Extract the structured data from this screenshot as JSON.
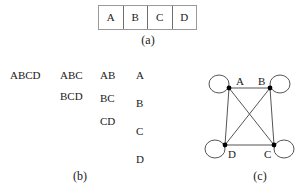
{
  "figure": {
    "background_color": "#ffffff",
    "line_color": "#555555",
    "node_color": "#000000",
    "table_border_color": "#6f6f6f"
  },
  "panel_a": {
    "caption": "(a)",
    "table": {
      "cells": [
        "A",
        "B",
        "C",
        "D"
      ]
    }
  },
  "panel_b": {
    "caption": "(b)",
    "columns": [
      {
        "items": [
          "ABCD"
        ]
      },
      {
        "items": [
          "ABC",
          "BCD"
        ]
      },
      {
        "items": [
          "AB",
          "BC",
          "CD"
        ]
      },
      {
        "items": [
          "A",
          "B",
          "C",
          "D"
        ]
      }
    ]
  },
  "panel_c": {
    "caption": "(c)",
    "nodes": [
      {
        "id": "A",
        "label": "A",
        "x": 29,
        "y": 18,
        "label_x": 36,
        "label_y": 15,
        "loop_side": "left"
      },
      {
        "id": "B",
        "label": "B",
        "x": 70,
        "y": 18,
        "label_x": 62,
        "label_y": 15,
        "loop_side": "right"
      },
      {
        "id": "D",
        "label": "D",
        "x": 25,
        "y": 75,
        "label_x": 31,
        "label_y": 86,
        "loop_side": "left"
      },
      {
        "id": "C",
        "label": "C",
        "x": 74,
        "y": 75,
        "label_x": 64,
        "label_y": 86,
        "loop_side": "right"
      }
    ],
    "edges": [
      {
        "from": "A",
        "to": "B"
      },
      {
        "from": "A",
        "to": "D"
      },
      {
        "from": "A",
        "to": "C"
      },
      {
        "from": "B",
        "to": "D"
      },
      {
        "from": "B",
        "to": "C"
      },
      {
        "from": "D",
        "to": "C"
      }
    ],
    "self_loops": [
      "A",
      "B",
      "C",
      "D"
    ]
  }
}
